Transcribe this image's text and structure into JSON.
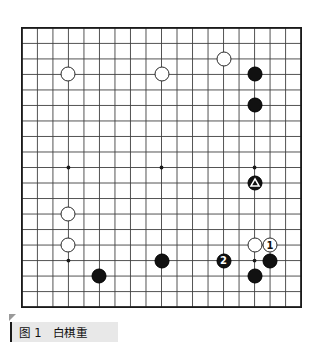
{
  "figure": {
    "caption_number": "图 1",
    "caption_text": "图 1　白棋重",
    "caption_title": "白棋重",
    "corner_marker": "corner-fold-marker"
  },
  "board": {
    "type": "go-board",
    "size": 19,
    "columns": 19,
    "rows": 19,
    "line_color": "#3a3a3a",
    "border_color": "#1a1a1a",
    "background_color": "#ffffff",
    "star_points": [
      {
        "col": 3,
        "row": 3
      },
      {
        "col": 9,
        "row": 3
      },
      {
        "col": 15,
        "row": 3
      },
      {
        "col": 3,
        "row": 9
      },
      {
        "col": 9,
        "row": 9
      },
      {
        "col": 15,
        "row": 9
      },
      {
        "col": 3,
        "row": 15
      },
      {
        "col": 9,
        "row": 15
      },
      {
        "col": 15,
        "row": 15
      }
    ]
  },
  "stones": [
    {
      "id": "w-d16",
      "color": "white",
      "col": 3,
      "row": 3,
      "label": "",
      "mark": ""
    },
    {
      "id": "w-k16",
      "color": "white",
      "col": 9,
      "row": 3,
      "label": "",
      "mark": ""
    },
    {
      "id": "w-o17",
      "color": "white",
      "col": 13,
      "row": 2,
      "label": "",
      "mark": ""
    },
    {
      "id": "b-q16",
      "color": "black",
      "col": 15,
      "row": 3,
      "label": "",
      "mark": ""
    },
    {
      "id": "b-q14",
      "color": "black",
      "col": 15,
      "row": 5,
      "label": "",
      "mark": ""
    },
    {
      "id": "b-q9",
      "color": "black",
      "col": 15,
      "row": 10,
      "label": "",
      "mark": "triangle"
    },
    {
      "id": "w-d7",
      "color": "white",
      "col": 3,
      "row": 12,
      "label": "",
      "mark": ""
    },
    {
      "id": "w-d5",
      "color": "white",
      "col": 3,
      "row": 14,
      "label": "",
      "mark": ""
    },
    {
      "id": "b-f4",
      "color": "black",
      "col": 5,
      "row": 16,
      "label": "",
      "mark": ""
    },
    {
      "id": "b-k4",
      "color": "black",
      "col": 9,
      "row": 15,
      "label": "",
      "mark": ""
    },
    {
      "id": "b-n4",
      "color": "black",
      "col": 13,
      "row": 15,
      "label": "2",
      "mark": "move-number"
    },
    {
      "id": "w-q5",
      "color": "white",
      "col": 15,
      "row": 14,
      "label": "",
      "mark": ""
    },
    {
      "id": "w-r5",
      "color": "white",
      "col": 16,
      "row": 14,
      "label": "1",
      "mark": "move-number"
    },
    {
      "id": "b-r4",
      "color": "black",
      "col": 16,
      "row": 15,
      "label": "",
      "mark": ""
    },
    {
      "id": "b-q3",
      "color": "black",
      "col": 15,
      "row": 16,
      "label": "",
      "mark": ""
    }
  ],
  "legend": {
    "triangle_meaning": "marked-stone",
    "white_move_label": "1",
    "black_move_label": "2"
  }
}
